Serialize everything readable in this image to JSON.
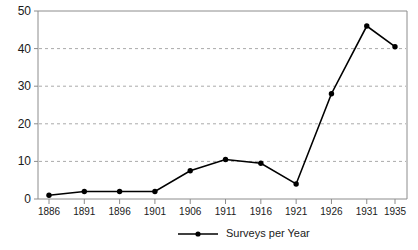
{
  "chart_data": {
    "type": "line",
    "title": "",
    "xlabel": "",
    "ylabel": "",
    "categories": [
      "1886",
      "1891",
      "1896",
      "1901",
      "1906",
      "1911",
      "1916",
      "1921",
      "1926",
      "1931",
      "1935"
    ],
    "x": [
      1886,
      1891,
      1896,
      1901,
      1906,
      1911,
      1916,
      1921,
      1926,
      1931,
      1935
    ],
    "series": [
      {
        "name": "Surveys per Year",
        "values": [
          1,
          2,
          2,
          2,
          7.5,
          10.5,
          9.5,
          4,
          28,
          46,
          40.5
        ],
        "color": "#000000",
        "marker": "circle"
      }
    ],
    "ylim": [
      0,
      50
    ],
    "yticks": [
      0,
      10,
      20,
      30,
      40,
      50
    ],
    "ytick_labels": [
      "0",
      "10",
      "20",
      "30",
      "40",
      "50"
    ],
    "grid": "horizontal-dashed",
    "legend_position": "bottom-center",
    "legend_entries": [
      "Surveys per Year"
    ]
  },
  "legend": {
    "label": "Surveys per Year"
  }
}
